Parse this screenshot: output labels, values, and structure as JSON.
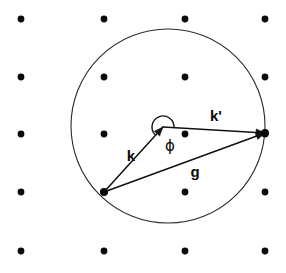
{
  "figure": {
    "name": "ewald-sphere-construction",
    "background_color": "#ffffff",
    "ink_color": "#0a0a0a",
    "circle_stroke_color": "#2b2b2b",
    "width": 286,
    "height": 273
  },
  "chart_data": {
    "type": "scatter",
    "title": "",
    "subtitle": "",
    "xlabel": "",
    "ylabel": "",
    "grid": false,
    "legend": "none",
    "xlim": [
      0,
      286
    ],
    "ylim": [
      0,
      273
    ],
    "lattice": {
      "name": "reciprocal-lattice-points",
      "columns_x": [
        21,
        104,
        185,
        265
      ],
      "rows_y": [
        19,
        77,
        134,
        192,
        251
      ],
      "dot_radius": 3.4,
      "count": 20,
      "points": [
        {
          "x": 21,
          "y": 19
        },
        {
          "x": 104,
          "y": 19
        },
        {
          "x": 185,
          "y": 19
        },
        {
          "x": 265,
          "y": 19
        },
        {
          "x": 21,
          "y": 77
        },
        {
          "x": 104,
          "y": 77
        },
        {
          "x": 185,
          "y": 77
        },
        {
          "x": 265,
          "y": 77
        },
        {
          "x": 21,
          "y": 134
        },
        {
          "x": 104,
          "y": 134
        },
        {
          "x": 185,
          "y": 134
        },
        {
          "x": 265,
          "y": 134
        },
        {
          "x": 21,
          "y": 192
        },
        {
          "x": 104,
          "y": 192
        },
        {
          "x": 185,
          "y": 192
        },
        {
          "x": 265,
          "y": 192
        },
        {
          "x": 21,
          "y": 251
        },
        {
          "x": 104,
          "y": 251
        },
        {
          "x": 185,
          "y": 251
        },
        {
          "x": 265,
          "y": 251
        }
      ]
    },
    "circle": {
      "name": "ewald-circle",
      "cx": 168,
      "cy": 126,
      "r": 97
    },
    "vertices": {
      "sphere_center": {
        "x": 163,
        "y": 127,
        "label": "ewald-center"
      },
      "origin_point": {
        "x": 104,
        "y": 192,
        "label": "lattice-origin-000"
      },
      "diffraction_point": {
        "x": 265,
        "y": 133,
        "label": "lattice-point-hkl"
      }
    },
    "vectors": [
      {
        "name": "k",
        "label": "k",
        "label_x": 131,
        "label_y": 157,
        "from": {
          "x": 104,
          "y": 192
        },
        "to": {
          "x": 163,
          "y": 127
        },
        "arrow": true,
        "description": "incident wavevector"
      },
      {
        "name": "k-prime",
        "label": "k'",
        "label_x": 216,
        "label_y": 117,
        "from": {
          "x": 163,
          "y": 127
        },
        "to": {
          "x": 265,
          "y": 133
        },
        "arrow": true,
        "description": "diffracted wavevector"
      },
      {
        "name": "g",
        "label": "g",
        "label_x": 195,
        "label_y": 173,
        "from": {
          "x": 104,
          "y": 192
        },
        "to": {
          "x": 265,
          "y": 133
        },
        "arrow": true,
        "description": "reciprocal lattice vector"
      }
    ],
    "angle": {
      "name": "phi",
      "label": "ϕ",
      "label_x": 170,
      "label_y": 146,
      "vertex": {
        "x": 163,
        "y": 127
      },
      "arc_radius": 11,
      "description": "scattering angle between k and k-prime"
    }
  }
}
